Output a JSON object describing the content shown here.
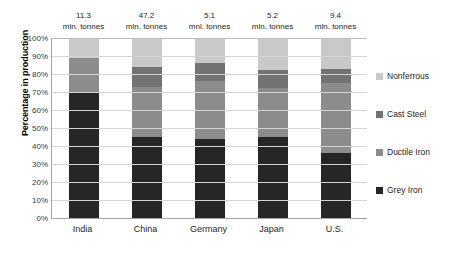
{
  "chart_data": {
    "type": "bar",
    "subtype": "stacked-100-percent",
    "title": "",
    "xlabel": "",
    "ylabel": "Percentage in production",
    "ylim": [
      0,
      100
    ],
    "ytick_labels": [
      "100%",
      "90%",
      "80%",
      "70%",
      "60%",
      "50%",
      "40%",
      "30%",
      "20%",
      "10%",
      "0%"
    ],
    "ytick_values": [
      100,
      90,
      80,
      70,
      60,
      50,
      40,
      30,
      20,
      10,
      0
    ],
    "grid": true,
    "legend_position": "right",
    "categories": [
      "India",
      "China",
      "Germany",
      "Japan",
      "U.S."
    ],
    "series": [
      {
        "name": "Grey Iron",
        "color": "#262626",
        "values": [
          70,
          45,
          44,
          45,
          36
        ]
      },
      {
        "name": "Ductile Iron",
        "color": "#8c8c8c",
        "values": [
          19,
          28,
          32,
          27,
          39
        ]
      },
      {
        "name": "Cast Steel",
        "color": "#737373",
        "values": [
          0,
          11,
          10,
          10,
          8
        ]
      },
      {
        "name": "Nonferrous",
        "color": "#c9c9c9",
        "values": [
          11,
          16,
          14,
          18,
          17
        ]
      }
    ],
    "annotations": [
      {
        "category": "India",
        "value": "11.3",
        "unit": "mln. tonnes"
      },
      {
        "category": "China",
        "value": "47.2",
        "unit": "mln. tonnes"
      },
      {
        "category": "Germany",
        "value": "5.1",
        "unit": "mnl. tonnes"
      },
      {
        "category": "Japan",
        "value": "5.2",
        "unit": "mln. tonnes"
      },
      {
        "category": "U.S.",
        "value": "9.4",
        "unit": "mln. tonnes"
      }
    ],
    "legend_entries": [
      {
        "label": "Nonferrous",
        "color": "#c9c9c9"
      },
      {
        "label": "Cast Steel",
        "color": "#737373"
      },
      {
        "label": "Ductile Iron",
        "color": "#8c8c8c"
      },
      {
        "label": "Grey Iron",
        "color": "#262626"
      }
    ]
  },
  "axis": {
    "y_title": "Percentage in production"
  },
  "colors": {
    "gridline": "#d4d4d4",
    "axis_line": "#a6a6a6",
    "background": "#ffffff",
    "text": "#262626"
  }
}
